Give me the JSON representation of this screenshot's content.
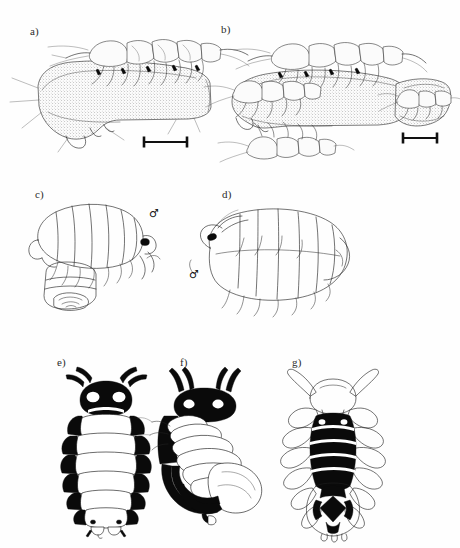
{
  "figure": {
    "kind": "scientific-plate",
    "background_color": "#fefefe",
    "ink_color": "#111111",
    "panel_count": 7,
    "rows": 3
  },
  "panels": [
    {
      "id": "a",
      "label": "a)",
      "label_x": 30,
      "label_y": 33,
      "view": "lateral view of amphipod attached to stippled host appendage",
      "has_scale_bar": true,
      "has_sex_symbol": false,
      "shading": "stipple"
    },
    {
      "id": "b",
      "label": "b)",
      "label_x": 221,
      "label_y": 31,
      "view": "lateral view of multiple amphipods on stippled host appendage and uropod",
      "has_scale_bar": true,
      "has_sex_symbol": false,
      "shading": "stipple"
    },
    {
      "id": "c",
      "label": "c)",
      "label_x": 35,
      "label_y": 196,
      "view": "outline drawing of isopod, oblique dorso-lateral, with attached male",
      "has_scale_bar": false,
      "has_sex_symbol": true,
      "shading": "outline"
    },
    {
      "id": "d",
      "label": "d)",
      "label_x": 222,
      "label_y": 196,
      "view": "outline drawing of isopod, lateral, with attached male",
      "has_scale_bar": false,
      "has_sex_symbol": true,
      "shading": "outline"
    },
    {
      "id": "e",
      "label": "e)",
      "label_x": 57,
      "label_y": 364,
      "view": "dorsal view of isopod with bold black pigmentation pattern",
      "has_scale_bar": false,
      "has_sex_symbol": false,
      "shading": "solid-black"
    },
    {
      "id": "f",
      "label": "f)",
      "label_x": 180,
      "label_y": 364,
      "view": "oblique dorsal view of asymmetric isopod with black pigmentation",
      "has_scale_bar": false,
      "has_sex_symbol": false,
      "shading": "solid-black"
    },
    {
      "id": "g",
      "label": "g)",
      "label_x": 292,
      "label_y": 364,
      "view": "ventral view of isopod with black pigmentation and pereopods",
      "has_scale_bar": false,
      "has_sex_symbol": false,
      "shading": "solid-black"
    }
  ],
  "scale_bars": [
    {
      "panel": "a",
      "x1": 143,
      "x2": 186,
      "y": 141,
      "style": "I-beam"
    },
    {
      "panel": "b",
      "x1": 402,
      "x2": 437,
      "y": 137,
      "style": "I-beam"
    }
  ],
  "sex_symbols": [
    {
      "panel": "c",
      "symbol": "♂",
      "x": 152,
      "y": 215
    },
    {
      "panel": "d",
      "symbol": "♂",
      "x": 192,
      "y": 276
    }
  ],
  "colors": {
    "ink": "#111111",
    "line": "#1d1d1d",
    "stipple": "#6f6f6f",
    "paper": "#fefefe",
    "black_fill": "#0a0a0a",
    "white_fill": "#ffffff"
  }
}
